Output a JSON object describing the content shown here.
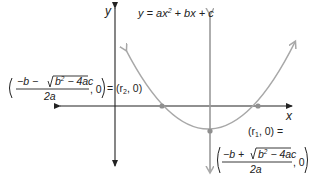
{
  "diagram": {
    "equation_label": {
      "lhs": "y = ax",
      "exp": "2",
      "rhs": " + bx + c"
    },
    "axes": {
      "x_label": "x",
      "y_label": "y"
    },
    "colors": {
      "axis": "#222222",
      "curve": "#a8a8a8",
      "symmetry_axis": "#9a9a9a",
      "points": "#8f8f8f",
      "text": "#222222"
    },
    "left_root": {
      "numerator": "−b − √(b² − 4ac)",
      "numerator_prefix": "−b − ",
      "radicand": "b² − 4ac",
      "radicand_base": "b",
      "radicand_exp": "2",
      "radicand_rest": " − 4ac",
      "denominator": "2a",
      "tail": ", 0",
      "equals": "= (r",
      "sub": "2",
      "close": ", 0)"
    },
    "right_root": {
      "label_open": "(r",
      "label_sub": "1",
      "label_close": ", 0) =",
      "numerator_prefix": "−b + ",
      "radicand_base": "b",
      "radicand_exp": "2",
      "radicand_rest": " − 4ac",
      "denominator": "2a",
      "tail": ", 0"
    },
    "points": [
      {
        "name": "root-r2",
        "x": 162,
        "y": 106
      },
      {
        "name": "root-r1",
        "x": 258,
        "y": 106
      },
      {
        "name": "vertex",
        "x": 210,
        "y": 131
      }
    ]
  }
}
